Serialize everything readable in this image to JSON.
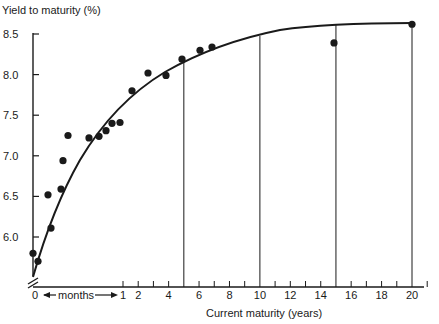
{
  "chart_data": {
    "type": "scatter",
    "title": "",
    "ylabel": "Yield to maturity (%)",
    "xlabel": "Current maturity (years)",
    "ylim": [
      5.6,
      8.6
    ],
    "y_ticks": [
      6.0,
      6.5,
      7.0,
      7.5,
      8.0,
      8.5
    ],
    "y_tick_labels": [
      "6.0",
      "6.5",
      "7.0",
      "7.5",
      "8.0",
      "8.5"
    ],
    "x_tick_labels": [
      "0",
      "1",
      "2",
      "4",
      "6",
      "8",
      "10",
      "12",
      "14",
      "16",
      "18",
      "20"
    ],
    "x_months_label": "months",
    "x_axis_note": "0 to 1 year in months (expanded scale), then years",
    "xlim_years": [
      0,
      21
    ],
    "grid": false,
    "legend": null,
    "vertical_guides_years": [
      5,
      10,
      15,
      20
    ],
    "series": [
      {
        "name": "observed yields",
        "kind": "points",
        "points": [
          {
            "x_px": 33,
            "y": 5.8
          },
          {
            "x_px": 38,
            "y": 5.7
          },
          {
            "x_px": 51,
            "y": 6.11
          },
          {
            "x_px": 48,
            "y": 6.52
          },
          {
            "x_px": 61,
            "y": 6.59
          },
          {
            "x_px": 63,
            "y": 6.94
          },
          {
            "x_px": 68,
            "y": 7.25
          },
          {
            "x_px": 89,
            "y": 7.22
          },
          {
            "x_px": 99,
            "y": 7.24
          },
          {
            "x_px": 106,
            "y": 7.31
          },
          {
            "x_px": 112,
            "y": 7.4
          },
          {
            "x_px": 120,
            "y": 7.41
          },
          {
            "x_px": 132,
            "y": 7.8
          },
          {
            "x_px": 148,
            "y": 8.02
          },
          {
            "x_px": 166,
            "y": 7.99
          },
          {
            "x_px": 182,
            "y": 8.19
          },
          {
            "x_px": 200,
            "y": 8.3
          },
          {
            "x_px": 212,
            "y": 8.34
          },
          {
            "x_px": 334,
            "y": 8.39
          },
          {
            "x_px": 412,
            "y": 8.62
          }
        ]
      },
      {
        "name": "fitted yield curve",
        "kind": "curve",
        "description": "Smooth concave upward-sloping curve from ~5.65 at 0 to ~8.62 at 20 years"
      }
    ]
  }
}
